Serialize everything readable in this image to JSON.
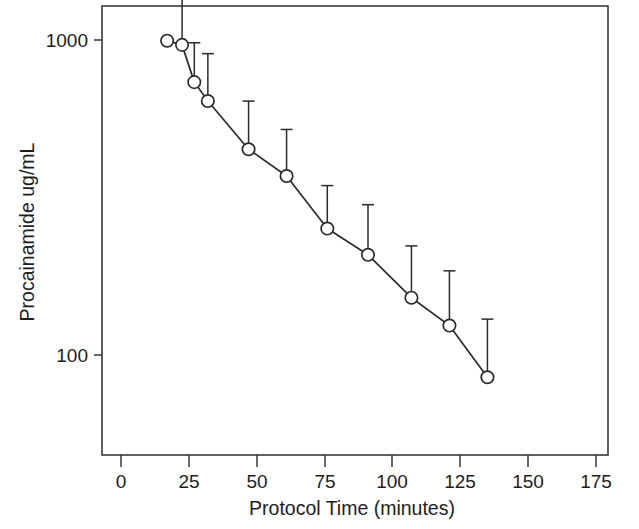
{
  "chart_data": {
    "type": "line",
    "title": "",
    "xlabel": "Protocol Time (minutes)",
    "ylabel": "Procainamide ug/mL",
    "yscale": "log",
    "xlim": [
      -8,
      186
    ],
    "ylim": [
      55,
      1450
    ],
    "grid": false,
    "legend": null,
    "xticks": [
      0,
      25,
      50,
      75,
      100,
      125,
      150,
      175
    ],
    "xticklabels": [
      "0",
      "25",
      "50",
      "75",
      "100",
      "125",
      "150",
      "175"
    ],
    "yticks": [
      1000,
      100
    ],
    "yticklabels": [
      "1000",
      "100"
    ],
    "series": [
      {
        "name": "Procainamide concentration",
        "marker": "open-circle",
        "errorbar": "upper-only",
        "x": [
          17,
          22.5,
          27,
          32,
          47,
          61,
          76,
          91,
          107,
          121,
          135
        ],
        "y": [
          995,
          965,
          735,
          640,
          450,
          370,
          252,
          208,
          152,
          124,
          85
        ],
        "yerr_upper": [
          1010,
          1420,
          980,
          905,
          640,
          520,
          345,
          300,
          222,
          185,
          130
        ]
      }
    ]
  },
  "axis": {
    "y_tick_1000": "1000",
    "y_tick_100": "100"
  }
}
